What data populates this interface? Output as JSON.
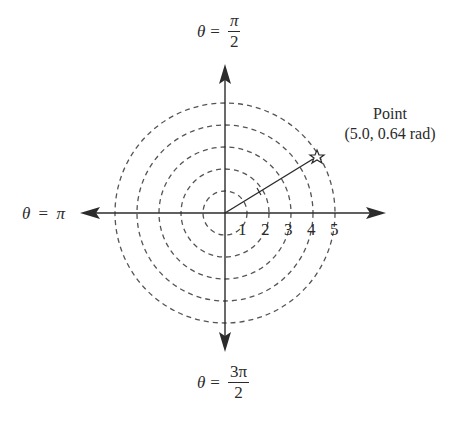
{
  "diagram": {
    "center_px": [
      225,
      213
    ],
    "ring_spacing_px": 22,
    "rings": [
      1,
      2,
      3,
      4,
      5
    ],
    "axis_ticks": [
      "1",
      "2",
      "3",
      "4",
      "5"
    ],
    "axis_labels": {
      "top": {
        "lhs": "θ",
        "eq": "=",
        "num": "π",
        "den": "2"
      },
      "left": {
        "lhs": "θ",
        "eq": "=",
        "rhs": "π"
      },
      "bottom": {
        "lhs": "θ",
        "eq": "=",
        "num": "3π",
        "den": "2"
      }
    },
    "point": {
      "title": "Point",
      "coords": "(5.0, 0.64 rad)",
      "r": 5.0,
      "theta_rad": 0.64,
      "marker": "star-icon"
    },
    "colors": {
      "line": "#2b2b2b",
      "dashed": "#555555",
      "background": "#ffffff"
    }
  }
}
